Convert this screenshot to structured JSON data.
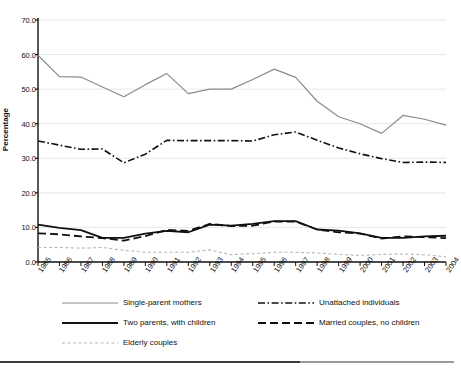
{
  "chart_data": {
    "type": "line",
    "title": "",
    "xlabel": "",
    "ylabel": "Percentage",
    "ylim": [
      0.0,
      70.0
    ],
    "ytick_values": [
      0.0,
      10.0,
      20.0,
      30.0,
      40.0,
      50.0,
      60.0,
      70.0
    ],
    "ytick_labels": [
      "0.0",
      "10.0",
      "20.0",
      "30.0",
      "40.0",
      "50.0",
      "60.0",
      "70.0"
    ],
    "grid": true,
    "legend_position": "below-axes",
    "categories": [
      "1985",
      "1986",
      "1987",
      "1988",
      "1989",
      "1990",
      "1991",
      "1992",
      "1993",
      "1994",
      "1995",
      "1996",
      "1997",
      "1998",
      "1999",
      "2000",
      "2001",
      "2002",
      "2003",
      "2004"
    ],
    "series": [
      {
        "name": "Single-parent mothers",
        "style": "solid-gray",
        "color": "#8c8c8c",
        "values": [
          59.8,
          53.6,
          53.5,
          50.6,
          47.8,
          51.3,
          54.5,
          48.7,
          50.0,
          50.0,
          52.8,
          55.8,
          53.4,
          46.5,
          42.0,
          40.0,
          37.2,
          42.4,
          41.3,
          39.6
        ]
      },
      {
        "name": "Unattached individuals",
        "style": "dash-dot-black",
        "color": "#111111",
        "values": [
          35.0,
          33.8,
          32.6,
          32.7,
          28.7,
          31.2,
          35.2,
          35.1,
          35.1,
          35.1,
          35.0,
          36.8,
          37.6,
          35.2,
          33.0,
          31.3,
          29.9,
          28.8,
          28.9,
          28.8
        ]
      },
      {
        "name": "Two parents, with children",
        "style": "solid-black",
        "color": "#111111",
        "values": [
          10.8,
          9.9,
          9.2,
          7.0,
          7.0,
          8.2,
          9.0,
          8.6,
          10.8,
          10.5,
          11.0,
          11.8,
          11.8,
          9.4,
          9.1,
          8.3,
          7.0,
          7.0,
          7.4,
          7.6
        ]
      },
      {
        "name": "Married couples, no children",
        "style": "dashed-black",
        "color": "#111111",
        "values": [
          8.3,
          8.0,
          7.4,
          6.9,
          6.2,
          7.5,
          9.3,
          9.0,
          11.0,
          10.4,
          10.5,
          11.7,
          11.7,
          9.4,
          8.6,
          8.2,
          6.8,
          7.4,
          7.2,
          6.9
        ]
      },
      {
        "name": "Elderly couples",
        "style": "dotted-gray",
        "color": "#b5b5b5",
        "values": [
          4.2,
          4.2,
          4.0,
          4.2,
          3.4,
          2.8,
          2.8,
          2.8,
          3.5,
          2.1,
          2.4,
          2.8,
          2.8,
          2.6,
          2.2,
          1.9,
          2.2,
          2.3,
          2.1,
          1.5
        ]
      }
    ]
  },
  "legend": {
    "items": [
      {
        "label": "Single-parent mothers"
      },
      {
        "label": "Unattached individuals"
      },
      {
        "label": "Two parents, with children"
      },
      {
        "label": "Married couples, no children"
      },
      {
        "label": "Elderly couples"
      }
    ]
  }
}
